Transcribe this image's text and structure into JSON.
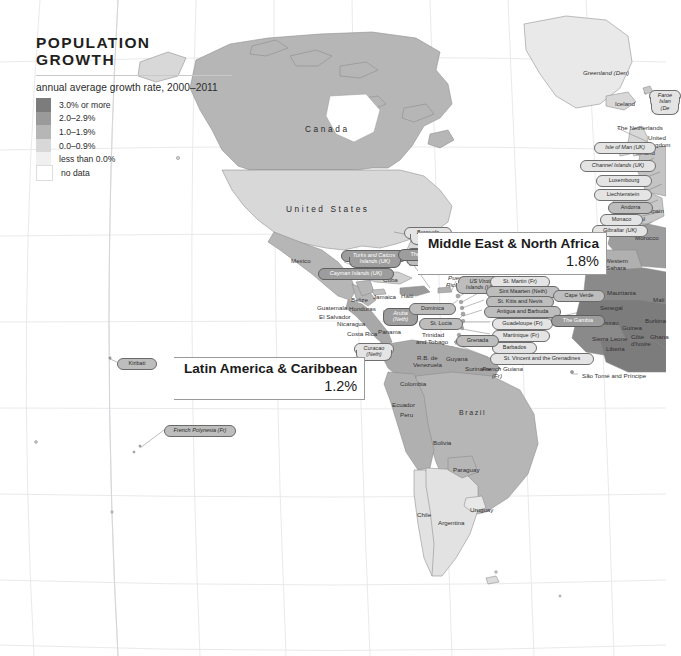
{
  "title": "POPULATION GROWTH",
  "legend": {
    "subtitle": "annual average growth rate, 2000–2011",
    "items": [
      {
        "label": "3.0% or more",
        "color": "#7c7c7c"
      },
      {
        "label": "2.0–2.9%",
        "color": "#9a9a9a"
      },
      {
        "label": "1.0–1.9%",
        "color": "#b6b6b6"
      },
      {
        "label": "0.0–0.9%",
        "color": "#d8d8d8"
      },
      {
        "label": "less than 0.0%",
        "color": "#f0f0f0"
      },
      {
        "label": "no data",
        "color": "#ffffff"
      }
    ]
  },
  "regions": [
    {
      "name": "Middle East & North Africa",
      "value": "1.8%"
    },
    {
      "name": "Latin America & Caribbean",
      "value": "1.2%"
    }
  ],
  "country_labels": [
    {
      "t": "Canada",
      "x": 305,
      "y": 125,
      "cls": "big"
    },
    {
      "t": "United States",
      "x": 286,
      "y": 205,
      "cls": "big"
    },
    {
      "t": "Greenland (Den)",
      "x": 583,
      "y": 70,
      "cls": "ital"
    },
    {
      "t": "Iceland",
      "x": 615,
      "y": 101,
      "cls": ""
    },
    {
      "t": "The Netherlands",
      "x": 617,
      "y": 125,
      "cls": ""
    },
    {
      "t": "United",
      "x": 648,
      "y": 135,
      "cls": ""
    },
    {
      "t": "Kingdom",
      "x": 646,
      "y": 142,
      "cls": ""
    },
    {
      "t": "Ireland",
      "x": 636,
      "y": 150,
      "cls": ""
    },
    {
      "t": "Spain",
      "x": 648,
      "y": 208,
      "cls": ""
    },
    {
      "t": "Portugal",
      "x": 622,
      "y": 216,
      "cls": ""
    },
    {
      "t": "Morocco",
      "x": 635,
      "y": 235,
      "cls": ""
    },
    {
      "t": "Western",
      "x": 605,
      "y": 258,
      "cls": ""
    },
    {
      "t": "Sahara",
      "x": 606,
      "y": 265,
      "cls": ""
    },
    {
      "t": "Mauritania",
      "x": 607,
      "y": 290,
      "cls": ""
    },
    {
      "t": "Senegal",
      "x": 600,
      "y": 305,
      "cls": ""
    },
    {
      "t": "Mali",
      "x": 653,
      "y": 297,
      "cls": ""
    },
    {
      "t": "Guinea-Bissau",
      "x": 578,
      "y": 320,
      "cls": ""
    },
    {
      "t": "Guinea",
      "x": 622,
      "y": 325,
      "cls": ""
    },
    {
      "t": "Burkina",
      "x": 645,
      "y": 318,
      "cls": ""
    },
    {
      "t": "Sierra Leone",
      "x": 592,
      "y": 336,
      "cls": ""
    },
    {
      "t": "Liberia",
      "x": 606,
      "y": 346,
      "cls": ""
    },
    {
      "t": "Côte",
      "x": 631,
      "y": 334,
      "cls": ""
    },
    {
      "t": "d'Ivoire",
      "x": 631,
      "y": 341,
      "cls": ""
    },
    {
      "t": "Ghana",
      "x": 650,
      "y": 334,
      "cls": ""
    },
    {
      "t": "Mexico",
      "x": 291,
      "y": 258,
      "cls": ""
    },
    {
      "t": "Belize",
      "x": 351,
      "y": 297,
      "cls": ""
    },
    {
      "t": "Guatemala",
      "x": 317,
      "y": 305,
      "cls": ""
    },
    {
      "t": "Honduras",
      "x": 349,
      "y": 306,
      "cls": ""
    },
    {
      "t": "El Salvador",
      "x": 319,
      "y": 314,
      "cls": ""
    },
    {
      "t": "Nicaragua",
      "x": 337,
      "y": 321,
      "cls": ""
    },
    {
      "t": "Costa Rica",
      "x": 347,
      "y": 331,
      "cls": ""
    },
    {
      "t": "Panama",
      "x": 378,
      "y": 329,
      "cls": ""
    },
    {
      "t": "Cuba",
      "x": 383,
      "y": 277,
      "cls": ""
    },
    {
      "t": "Jamaica",
      "x": 373,
      "y": 294,
      "cls": ""
    },
    {
      "t": "Haiti",
      "x": 401,
      "y": 293,
      "cls": ""
    },
    {
      "t": "Dominican",
      "x": 420,
      "y": 261,
      "cls": ""
    },
    {
      "t": "Republic",
      "x": 421,
      "y": 268,
      "cls": ""
    },
    {
      "t": "Puerto",
      "x": 448,
      "y": 275,
      "cls": "ital"
    },
    {
      "t": "Rico (US)",
      "x": 446,
      "y": 282,
      "cls": "ital"
    },
    {
      "t": "Colombia",
      "x": 400,
      "y": 381,
      "cls": ""
    },
    {
      "t": "R.B. de",
      "x": 417,
      "y": 355,
      "cls": ""
    },
    {
      "t": "Venezuela",
      "x": 413,
      "y": 362,
      "cls": ""
    },
    {
      "t": "Guyana",
      "x": 446,
      "y": 356,
      "cls": ""
    },
    {
      "t": "Suriname",
      "x": 465,
      "y": 366,
      "cls": ""
    },
    {
      "t": "Trinidad",
      "x": 422,
      "y": 332,
      "cls": ""
    },
    {
      "t": "and Tobago",
      "x": 416,
      "y": 339,
      "cls": ""
    },
    {
      "t": "French Guiana",
      "x": 482,
      "y": 366,
      "cls": "ital"
    },
    {
      "t": "(Fr)",
      "x": 492,
      "y": 373,
      "cls": "ital"
    },
    {
      "t": "Ecuador",
      "x": 392,
      "y": 402,
      "cls": ""
    },
    {
      "t": "Peru",
      "x": 400,
      "y": 412,
      "cls": ""
    },
    {
      "t": "Brazil",
      "x": 459,
      "y": 409,
      "cls": "med"
    },
    {
      "t": "Bolivia",
      "x": 433,
      "y": 440,
      "cls": ""
    },
    {
      "t": "Paraguay",
      "x": 453,
      "y": 467,
      "cls": ""
    },
    {
      "t": "Uruguay",
      "x": 470,
      "y": 507,
      "cls": ""
    },
    {
      "t": "Chile",
      "x": 417,
      "y": 512,
      "cls": ""
    },
    {
      "t": "Argentina",
      "x": 438,
      "y": 520,
      "cls": ""
    },
    {
      "t": "São Tomé and Príncipe",
      "x": 582,
      "y": 373,
      "cls": ""
    }
  ],
  "pill_labels": [
    {
      "t": "Bermuda",
      "x": 404,
      "y": 227,
      "w": 38,
      "fill": "l",
      "ital": true
    },
    {
      "t": "(UK)",
      "x": 410,
      "y": 234,
      "w": 26,
      "fill": "l",
      "ital": true,
      "nb": true
    },
    {
      "t": "British Virgin",
      "x": 406,
      "y": 248,
      "w": 42,
      "fill": "m",
      "ital": true
    },
    {
      "t": "Islands (UK)",
      "x": 406,
      "y": 255,
      "w": 42,
      "fill": "m",
      "ital": true,
      "nb": true
    },
    {
      "t": "Turks and Caicos",
      "x": 341,
      "y": 250,
      "w": 56,
      "fill": "d",
      "ital": true
    },
    {
      "t": "Islands (UK)",
      "x": 349,
      "y": 257,
      "w": 42,
      "fill": "d",
      "ital": true,
      "nb": true
    },
    {
      "t": "The Bahamas",
      "x": 398,
      "y": 249,
      "w": 49,
      "fill": "d"
    },
    {
      "t": "Cayman Islands (UK)",
      "x": 318,
      "y": 268,
      "w": 66,
      "fill": "d",
      "ital": true
    },
    {
      "t": "Aruba",
      "x": 383,
      "y": 308,
      "w": 25,
      "fill": "d",
      "ital": true
    },
    {
      "t": "(Neth)",
      "x": 383,
      "y": 315,
      "w": 25,
      "fill": "d",
      "ital": true,
      "nb": true
    },
    {
      "t": "Curaçao",
      "x": 354,
      "y": 343,
      "w": 30,
      "fill": "l",
      "ital": true
    },
    {
      "t": "(Neth)",
      "x": 356,
      "y": 350,
      "w": 26,
      "fill": "l",
      "ital": true,
      "nb": true
    },
    {
      "t": "Dominica",
      "x": 409,
      "y": 303,
      "w": 37,
      "fill": "m"
    },
    {
      "t": "St. Lucia",
      "x": 419,
      "y": 318,
      "w": 34,
      "fill": "m"
    },
    {
      "t": "US Virgin",
      "x": 458,
      "y": 276,
      "w": 36,
      "fill": "m",
      "ital": true
    },
    {
      "t": "Islands (US)",
      "x": 456,
      "y": 283,
      "w": 40,
      "fill": "m",
      "ital": true,
      "nb": true
    },
    {
      "t": "St. Martin (Fr)",
      "x": 490,
      "y": 276,
      "w": 50,
      "fill": "l"
    },
    {
      "t": "Sint Maarten (Neth)",
      "x": 486,
      "y": 286,
      "w": 64,
      "fill": "m"
    },
    {
      "t": "St. Kitts and Nevis",
      "x": 486,
      "y": 296,
      "w": 58,
      "fill": "m"
    },
    {
      "t": "Antigua and Barbuda",
      "x": 484,
      "y": 306,
      "w": 67,
      "fill": "m"
    },
    {
      "t": "Guadeloupe (Fr)",
      "x": 492,
      "y": 318,
      "w": 51,
      "fill": "l"
    },
    {
      "t": "Martinique (Fr)",
      "x": 492,
      "y": 330,
      "w": 48,
      "fill": "l"
    },
    {
      "t": "Barbados",
      "x": 492,
      "y": 342,
      "w": 35,
      "fill": "l"
    },
    {
      "t": "St. Vincent and the Grenadines",
      "x": 490,
      "y": 353,
      "w": 94,
      "fill": "l"
    },
    {
      "t": "Grenada",
      "x": 456,
      "y": 335,
      "w": 33,
      "fill": "m"
    },
    {
      "t": "Cape Verde",
      "x": 553,
      "y": 290,
      "w": 42,
      "fill": "m"
    },
    {
      "t": "The Gambia",
      "x": 551,
      "y": 315,
      "w": 44,
      "fill": "d"
    },
    {
      "t": "Isle of Man (UK)",
      "x": 594,
      "y": 142,
      "w": 52,
      "fill": "l",
      "ital": true
    },
    {
      "t": "Channel Islands (UK)",
      "x": 580,
      "y": 160,
      "w": 66,
      "fill": "l",
      "ital": true
    },
    {
      "t": "Luxembourg",
      "x": 596,
      "y": 175,
      "w": 46,
      "fill": "l"
    },
    {
      "t": "Liechtenstein",
      "x": 594,
      "y": 189,
      "w": 48,
      "fill": "l"
    },
    {
      "t": "Andorra",
      "x": 608,
      "y": 202,
      "w": 35,
      "fill": "m"
    },
    {
      "t": "Monaco",
      "x": 600,
      "y": 214,
      "w": 33,
      "fill": "l"
    },
    {
      "t": "Gibraltar (UK)",
      "x": 592,
      "y": 225,
      "w": 46,
      "fill": "l",
      "ital": true
    },
    {
      "t": "Faroe",
      "x": 649,
      "y": 90,
      "w": 22,
      "fill": "l",
      "ital": true
    },
    {
      "t": "Islan",
      "x": 650,
      "y": 97,
      "w": 20,
      "fill": "l",
      "ital": true,
      "nb": true
    },
    {
      "t": "(De",
      "x": 651,
      "y": 104,
      "w": 18,
      "fill": "l",
      "ital": true,
      "nb": true
    },
    {
      "t": "Kiribati",
      "x": 117,
      "y": 358,
      "w": 30,
      "fill": "m"
    },
    {
      "t": "French Polynesia (Fr)",
      "x": 164,
      "y": 425,
      "w": 62,
      "fill": "m",
      "ital": true
    }
  ]
}
